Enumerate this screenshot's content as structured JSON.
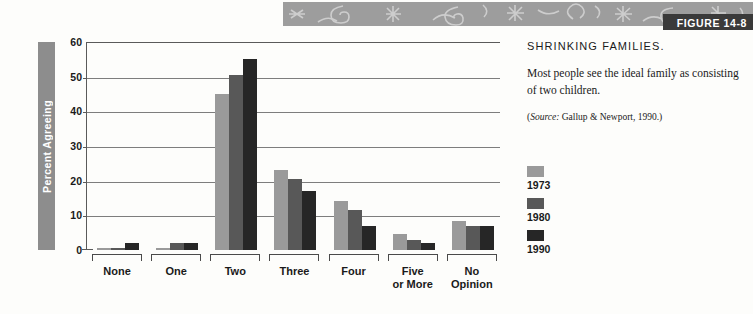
{
  "figure": {
    "tag": "FIGURE 14-8"
  },
  "side": {
    "title": "SHRINKING FAMILIES.",
    "description": "Most people see the ideal family as consisting of two children.",
    "source_prefix": "(",
    "source_italic": "Source:",
    "source_rest": " Gallup & Newport, 1990.)"
  },
  "legend": {
    "position": "right",
    "items": [
      {
        "label": "1973",
        "color": "#9a9a9a"
      },
      {
        "label": "1980",
        "color": "#585858"
      },
      {
        "label": "1990",
        "color": "#262626"
      }
    ]
  },
  "chart_data": {
    "type": "bar",
    "title": "SHRINKING FAMILIES.",
    "subtitle": "Most people see the ideal family as consisting of two children.",
    "source": "(Source: Gallup & Newport, 1990.)",
    "xlabel": "",
    "ylabel": "Percent Agreeing",
    "ylim": [
      0,
      60
    ],
    "yticks": [
      0,
      10,
      20,
      30,
      40,
      50,
      60
    ],
    "gridlines": [
      10,
      20,
      30,
      40,
      50
    ],
    "grid": true,
    "categories": [
      "None",
      "One",
      "Two",
      "Three",
      "Four",
      "Five\nor More",
      "No\nOpinion"
    ],
    "series": [
      {
        "name": "1973",
        "color": "#9a9a9a",
        "values": [
          0.5,
          0.5,
          45,
          23,
          14,
          4.5,
          8.5
        ]
      },
      {
        "name": "1980",
        "color": "#585858",
        "values": [
          0.5,
          2,
          50.5,
          20.5,
          11.5,
          3,
          7
        ]
      },
      {
        "name": "1990",
        "color": "#262626",
        "values": [
          2,
          2,
          55,
          17,
          7,
          2,
          7
        ]
      }
    ]
  }
}
